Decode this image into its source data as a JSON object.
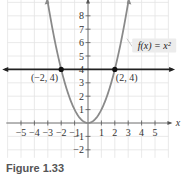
{
  "chart_data": {
    "type": "line",
    "title": "",
    "xlabel": "x",
    "ylabel": "y",
    "xlim": [
      -6,
      6
    ],
    "ylim": [
      -3,
      9
    ],
    "grid": true,
    "x_ticks": [
      "-5",
      "-4",
      "-3",
      "-2",
      "-1",
      "1",
      "2",
      "3",
      "4",
      "5"
    ],
    "y_ticks": [
      "8",
      "7",
      "6",
      "5",
      "4",
      "3",
      "2",
      "1",
      "-1",
      "-2"
    ],
    "series": [
      {
        "name": "f(x) = x²",
        "kind": "parabola",
        "x": [
          -3,
          -2,
          -1,
          0,
          1,
          2,
          3
        ],
        "y": [
          9,
          4,
          1,
          0,
          1,
          4,
          9
        ],
        "color": "#8a8a8a"
      },
      {
        "name": "y = 4",
        "kind": "horizontal-line",
        "y": 4,
        "color": "#222222"
      }
    ],
    "points": [
      {
        "label": "(−2, 4)",
        "x": -2,
        "y": 4
      },
      {
        "label": "(2, 4)",
        "x": 2,
        "y": 4
      }
    ],
    "annotations": [
      {
        "text": "f(x) = x²",
        "x": 3.4,
        "y": 5.2
      }
    ]
  },
  "labels": {
    "x_axis": "x",
    "func_label": "f(x) = x²",
    "point_left": "(−2, 4)",
    "point_right": "(2, 4)",
    "caption": "Figure 1.33"
  }
}
